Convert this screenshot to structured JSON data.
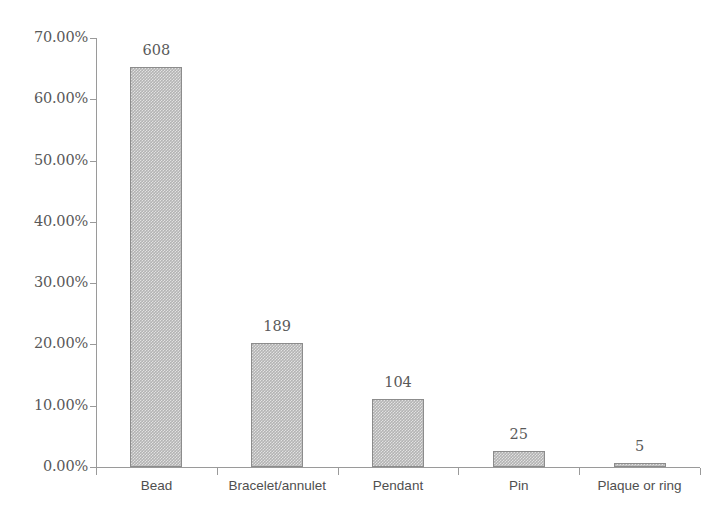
{
  "chart_data": {
    "type": "bar",
    "title": "",
    "subtitle": "",
    "xlabel": "",
    "ylabel": "",
    "categories": [
      "Bead",
      "Bracelet/annulet",
      "Pendant",
      "Pin",
      "Plaque or ring"
    ],
    "values": [
      65.31,
      20.3,
      11.17,
      2.69,
      0.54
    ],
    "counts": [
      608,
      189,
      104,
      25,
      5
    ],
    "data_labels": [
      "608",
      "189",
      "104",
      "25",
      "5"
    ],
    "total_count": 931,
    "value_unit": "percent",
    "ylim": [
      0,
      70
    ],
    "ytick_labels": [
      "0.00%",
      "10.00%",
      "20.00%",
      "30.00%",
      "40.00%",
      "50.00%",
      "60.00%",
      "70.00%"
    ],
    "ytick_values": [
      0,
      10,
      20,
      30,
      40,
      50,
      60,
      70
    ],
    "grid": false,
    "legend": false,
    "legend_position": "none",
    "bar_fill_color": "#b3b3b3",
    "bar_border_color": "#8c8c8c",
    "axis_color": "#9a9a9a",
    "text_color": "#595959",
    "background_color": "#ffffff"
  }
}
